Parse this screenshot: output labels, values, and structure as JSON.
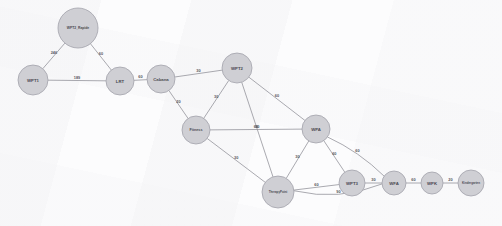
{
  "diagram": {
    "type": "node-link-graph",
    "background_color": "#fcfcfd",
    "node_fill": "#cfcfd4",
    "node_stroke": "#a2a2ab",
    "edge_color": "#8d8d96",
    "label_color": "#4a4a52"
  },
  "graph_data": {
    "type": "network",
    "directed": false,
    "weighted": true,
    "nodes": [
      {
        "id": "wpt2_rapide",
        "label": "WPT2_Rapide",
        "x": 78,
        "y": 28,
        "r": 20
      },
      {
        "id": "wpt1",
        "label": "WPT1",
        "x": 33,
        "y": 80,
        "r": 15
      },
      {
        "id": "lrt",
        "label": "LRT",
        "x": 120,
        "y": 81,
        "r": 14
      },
      {
        "id": "cabana",
        "label": "Cabana",
        "x": 161,
        "y": 79,
        "r": 14
      },
      {
        "id": "wpt2",
        "label": "WPT2",
        "x": 237,
        "y": 68,
        "r": 15
      },
      {
        "id": "fitness",
        "label": "Fitness",
        "x": 196,
        "y": 130,
        "r": 14
      },
      {
        "id": "wpa",
        "label": "WPA",
        "x": 316,
        "y": 129,
        "r": 14
      },
      {
        "id": "therapy",
        "label": "TherapyPoint",
        "x": 278,
        "y": 192,
        "r": 16
      },
      {
        "id": "wpt3",
        "label": "WPT3",
        "x": 352,
        "y": 183,
        "r": 13
      },
      {
        "id": "wfa",
        "label": "WFA",
        "x": 394,
        "y": 183,
        "r": 12
      },
      {
        "id": "wpk",
        "label": "WPK",
        "x": 432,
        "y": 183,
        "r": 11
      },
      {
        "id": "kindergarten",
        "label": "Kindergarten",
        "x": 471,
        "y": 183,
        "r": 13
      }
    ],
    "edges": [
      {
        "source": "wpt1",
        "target": "wpt2_rapide",
        "weight": "246"
      },
      {
        "source": "wpt2_rapide",
        "target": "lrt",
        "weight": "60"
      },
      {
        "source": "wpt1",
        "target": "lrt",
        "weight": "189"
      },
      {
        "source": "lrt",
        "target": "cabana",
        "weight": "60"
      },
      {
        "source": "cabana",
        "target": "wpt2",
        "weight": "30"
      },
      {
        "source": "cabana",
        "target": "fitness",
        "weight": "20"
      },
      {
        "source": "wpt2",
        "target": "fitness",
        "weight": "30"
      },
      {
        "source": "wpt2",
        "target": "wpa",
        "weight": "60"
      },
      {
        "source": "wpt2",
        "target": "therapy",
        "weight": "90"
      },
      {
        "source": "fitness",
        "target": "wpa",
        "weight": "60"
      },
      {
        "source": "fitness",
        "target": "therapy",
        "weight": "30"
      },
      {
        "source": "wpa",
        "target": "therapy",
        "weight": "30"
      },
      {
        "source": "wpa",
        "target": "wpt3",
        "weight": "60"
      },
      {
        "source": "wpa",
        "target": "wfa",
        "weight": "60"
      },
      {
        "source": "therapy",
        "target": "wpt3",
        "weight": "60"
      },
      {
        "source": "therapy",
        "target": "wfa",
        "weight": "90"
      },
      {
        "source": "wpt3",
        "target": "wfa",
        "weight": "30"
      },
      {
        "source": "wfa",
        "target": "wpk",
        "weight": "60"
      },
      {
        "source": "wpk",
        "target": "kindergarten",
        "weight": "20"
      }
    ]
  }
}
